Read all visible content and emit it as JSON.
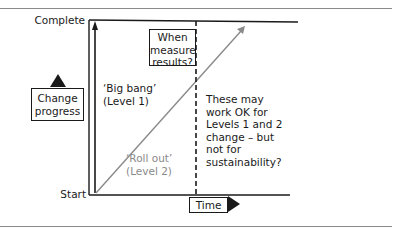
{
  "diagram": {
    "y_axis": {
      "top_label": "Complete",
      "bottom_label": "Start",
      "title_line1": "Change",
      "title_line2": "progress"
    },
    "x_axis": {
      "title": "Time"
    },
    "annotations": {
      "measure_box": {
        "line1": "When",
        "line2": "measure",
        "line3": "results?"
      },
      "big_bang": {
        "line1": "‘Big bang’",
        "line2": "(Level 1)"
      },
      "roll_out": {
        "line1": "‘Roll out’",
        "line2": "(Level 2)"
      },
      "note": {
        "line1": "These may",
        "line2": "work OK for",
        "line3": "Levels 1 and 2",
        "line4": "change – but",
        "line5": "not for",
        "line6": "sustainability?"
      }
    },
    "colors": {
      "line": "#1a1a1a",
      "diagonal": "#8a8a8a",
      "rule": "#8a8a8a"
    }
  }
}
